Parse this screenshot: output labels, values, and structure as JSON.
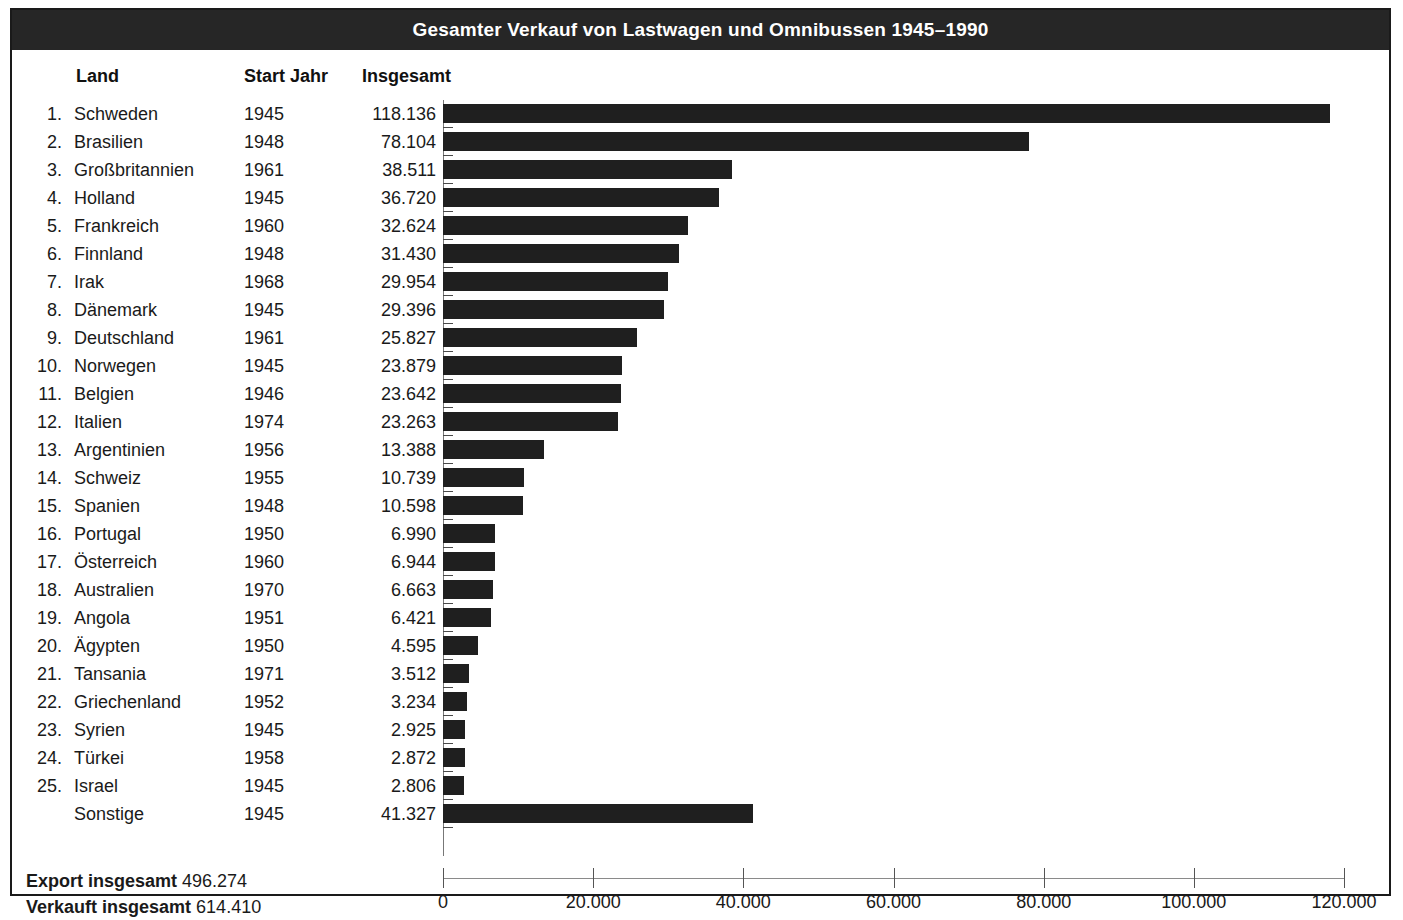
{
  "title": "Gesamter Verkauf von Lastwagen und Omnibussen 1945–1990",
  "columns": {
    "land": "Land",
    "start_jahr": "Start Jahr",
    "insgesamt": "Insgesamt"
  },
  "footer": {
    "export_label": "Export insgesamt",
    "export_value": "496.274",
    "sold_label": "Verkauft insgesamt",
    "sold_value": "614.410"
  },
  "colors": {
    "bar": "#1f1f1f",
    "title_bar": "#262626",
    "title_text": "#ffffff",
    "frame": "#1a1a1a",
    "axis": "#8a8a8a"
  },
  "rows": [
    {
      "rank": "1.",
      "country": "Schweden",
      "start": "1945",
      "total_text": "118.136",
      "value": 118136
    },
    {
      "rank": "2.",
      "country": "Brasilien",
      "start": "1948",
      "total_text": "78.104",
      "value": 78104
    },
    {
      "rank": "3.",
      "country": "Großbritannien",
      "start": "1961",
      "total_text": "38.511",
      "value": 38511
    },
    {
      "rank": "4.",
      "country": "Holland",
      "start": "1945",
      "total_text": "36.720",
      "value": 36720
    },
    {
      "rank": "5.",
      "country": "Frankreich",
      "start": "1960",
      "total_text": "32.624",
      "value": 32624
    },
    {
      "rank": "6.",
      "country": "Finnland",
      "start": "1948",
      "total_text": "31.430",
      "value": 31430
    },
    {
      "rank": "7.",
      "country": "Irak",
      "start": "1968",
      "total_text": "29.954",
      "value": 29954
    },
    {
      "rank": "8.",
      "country": "Dänemark",
      "start": "1945",
      "total_text": "29.396",
      "value": 29396
    },
    {
      "rank": "9.",
      "country": "Deutschland",
      "start": "1961",
      "total_text": "25.827",
      "value": 25827
    },
    {
      "rank": "10.",
      "country": "Norwegen",
      "start": "1945",
      "total_text": "23.879",
      "value": 23879
    },
    {
      "rank": "11.",
      "country": "Belgien",
      "start": "1946",
      "total_text": "23.642",
      "value": 23642
    },
    {
      "rank": "12.",
      "country": "Italien",
      "start": "1974",
      "total_text": "23.263",
      "value": 23263
    },
    {
      "rank": "13.",
      "country": "Argentinien",
      "start": "1956",
      "total_text": "13.388",
      "value": 13388
    },
    {
      "rank": "14.",
      "country": "Schweiz",
      "start": "1955",
      "total_text": "10.739",
      "value": 10739
    },
    {
      "rank": "15.",
      "country": "Spanien",
      "start": "1948",
      "total_text": "10.598",
      "value": 10598
    },
    {
      "rank": "16.",
      "country": "Portugal",
      "start": "1950",
      "total_text": "6.990",
      "value": 6990
    },
    {
      "rank": "17.",
      "country": "Österreich",
      "start": "1960",
      "total_text": "6.944",
      "value": 6944
    },
    {
      "rank": "18.",
      "country": "Australien",
      "start": "1970",
      "total_text": "6.663",
      "value": 6663
    },
    {
      "rank": "19.",
      "country": "Angola",
      "start": "1951",
      "total_text": "6.421",
      "value": 6421
    },
    {
      "rank": "20.",
      "country": "Ägypten",
      "start": "1950",
      "total_text": "4.595",
      "value": 4595
    },
    {
      "rank": "21.",
      "country": "Tansania",
      "start": "1971",
      "total_text": "3.512",
      "value": 3512
    },
    {
      "rank": "22.",
      "country": "Griechenland",
      "start": "1952",
      "total_text": "3.234",
      "value": 3234
    },
    {
      "rank": "23.",
      "country": "Syrien",
      "start": "1945",
      "total_text": "2.925",
      "value": 2925
    },
    {
      "rank": "24.",
      "country": "Türkei",
      "start": "1958",
      "total_text": "2.872",
      "value": 2872
    },
    {
      "rank": "25.",
      "country": "Israel",
      "start": "1945",
      "total_text": "2.806",
      "value": 2806
    },
    {
      "rank": "",
      "country": "Sonstige",
      "start": "1945",
      "total_text": "41.327",
      "value": 41327
    }
  ],
  "xaxis": {
    "ticks": [
      0,
      20000,
      40000,
      60000,
      80000,
      100000,
      120000
    ],
    "tick_labels": [
      "0",
      "20.000",
      "40.000",
      "60.000",
      "80.000",
      "100.000",
      "120.000"
    ],
    "min": 0,
    "max": 120000
  },
  "chart_data": {
    "type": "bar",
    "orientation": "horizontal",
    "title": "Gesamter Verkauf von Lastwagen und Omnibussen 1945–1990",
    "xlabel": "",
    "ylabel": "",
    "xlim": [
      0,
      120000
    ],
    "grid": false,
    "legend": null,
    "categories": [
      "Schweden",
      "Brasilien",
      "Großbritannien",
      "Holland",
      "Frankreich",
      "Finnland",
      "Irak",
      "Dänemark",
      "Deutschland",
      "Norwegen",
      "Belgien",
      "Italien",
      "Argentinien",
      "Schweiz",
      "Spanien",
      "Portugal",
      "Österreich",
      "Australien",
      "Angola",
      "Ägypten",
      "Tansania",
      "Griechenland",
      "Syrien",
      "Türkei",
      "Israel",
      "Sonstige"
    ],
    "values": [
      118136,
      78104,
      38511,
      36720,
      32624,
      31430,
      29954,
      29396,
      25827,
      23879,
      23642,
      23263,
      13388,
      10739,
      10598,
      6990,
      6944,
      6663,
      6421,
      4595,
      3512,
      3234,
      2925,
      2872,
      2806,
      41327
    ],
    "start_years": [
      1945,
      1948,
      1961,
      1945,
      1960,
      1948,
      1968,
      1945,
      1961,
      1945,
      1946,
      1974,
      1956,
      1955,
      1948,
      1950,
      1960,
      1970,
      1951,
      1950,
      1971,
      1952,
      1945,
      1958,
      1945,
      1945
    ],
    "xticks": [
      0,
      20000,
      40000,
      60000,
      80000,
      100000,
      120000
    ],
    "xtick_labels": [
      "0",
      "20.000",
      "40.000",
      "60.000",
      "80.000",
      "100.000",
      "120.000"
    ],
    "annotations": {
      "export_insgesamt": 496274,
      "verkauft_insgesamt": 614410
    }
  }
}
